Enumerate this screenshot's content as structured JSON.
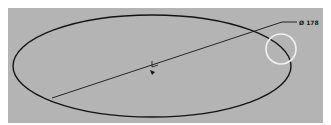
{
  "canvas": {
    "background": "#ffffff",
    "panel_color": "#b4b4b4",
    "line_color": "#141414",
    "highlight_color": "#f2f2f2"
  },
  "drawing": {
    "shape": "ellipse",
    "dimension": {
      "type": "diameter",
      "label": "Ø 178"
    },
    "center_marker": "origin-axis-icon",
    "highlight": "selection-circle"
  }
}
